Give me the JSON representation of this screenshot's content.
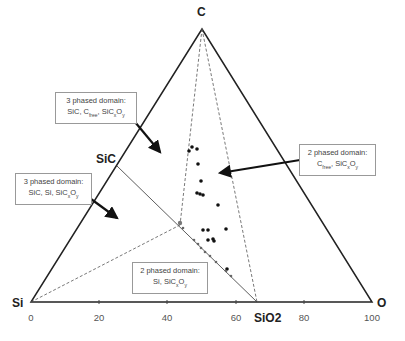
{
  "vertices": {
    "top": "C",
    "left": "Si",
    "right": "O"
  },
  "points": {
    "sic": "SiC",
    "sio2": "SiO2"
  },
  "axis": {
    "ticks": [
      "0",
      "20",
      "40",
      "60",
      "80",
      "100"
    ]
  },
  "annotations": [
    {
      "line1": "3 phased domain:",
      "line2": "SiC, C<sub>free</sub>, SiC<sub>x</sub>O<sub>y</sub>"
    },
    {
      "line1": "2 phased domain:",
      "line2": "C<sub>free</sub>, SiC<sub>x</sub>O<sub>y</sub>"
    },
    {
      "line1": "3 phased domain:",
      "line2": "SiC, Si, SiC<sub>x</sub>O<sub>y</sub>"
    },
    {
      "line1": "2 phased domain:",
      "line2": "Si, SiC<sub>x</sub>O<sub>y</sub>"
    }
  ],
  "colors": {
    "line": "#222222",
    "dash": "#555555",
    "marker": "#111111"
  },
  "chart_data": {
    "type": "scatter",
    "axes": [
      "Si",
      "C",
      "O"
    ],
    "tick_labels": [
      "0",
      "20",
      "40",
      "60",
      "80",
      "100"
    ],
    "regions": [
      "3 phased domain: SiC, Cfree, SiCxOy",
      "2 phased domain: Cfree, SiCxOy",
      "3 phased domain: SiC, Si, SiCxOy",
      "2 phased domain: Si, SiCxOy"
    ]
  }
}
